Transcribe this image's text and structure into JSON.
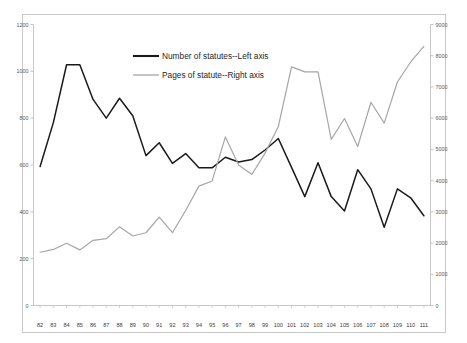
{
  "chart_data": {
    "type": "line",
    "title": "",
    "xlabel": "",
    "ylabel": "",
    "grid": false,
    "legend_position": "upper-center",
    "categories": [
      "82",
      "83",
      "84",
      "85",
      "86",
      "87",
      "88",
      "89",
      "90",
      "91",
      "92",
      "93",
      "94",
      "95",
      "96",
      "97",
      "98",
      "99",
      "100",
      "101",
      "102",
      "103",
      "104",
      "105",
      "106",
      "107",
      "108",
      "109",
      "110",
      "111"
    ],
    "axes": {
      "left": {
        "label": "Number of statutes",
        "min": 0,
        "max": 1200,
        "step": 200,
        "ticks": [
          "0",
          "200",
          "400",
          "600",
          "800",
          "1000",
          "1200"
        ]
      },
      "right": {
        "label": "Pages of statute",
        "min": 0,
        "max": 9000,
        "step": 1000,
        "ticks": [
          "0",
          "1000",
          "2000",
          "3000",
          "4000",
          "5000",
          "6000",
          "7000",
          "8000",
          "9000"
        ]
      }
    },
    "series": [
      {
        "name": "Number of statutes--Left axis",
        "axis": "left",
        "color": "#1a1a1a",
        "values": [
          594,
          781,
          1028,
          1028,
          880,
          800,
          885,
          810,
          640,
          695,
          607,
          649,
          588,
          588,
          633,
          613,
          623,
          664,
          713,
          590,
          465,
          610,
          465,
          404,
          580,
          498,
          334,
          498,
          460,
          383
        ]
      },
      {
        "name": "Pages of statute--Right axis",
        "axis": "right",
        "color": "#a6a6a6",
        "values": [
          1706,
          1795,
          1993,
          1781,
          2089,
          2139,
          2519,
          2225,
          2330,
          2834,
          2331,
          3043,
          3824,
          3989,
          5400,
          4500,
          4195,
          4880,
          5733,
          7641,
          7481,
          7484,
          5319,
          5989,
          5093,
          6510,
          5841,
          7157,
          7800,
          8300
        ]
      }
    ],
    "legend": [
      {
        "label": "Number of statutes--Left axis",
        "color": "#1a1a1a"
      },
      {
        "label": "Pages of statute--Right axis",
        "color": "#a6a6a6"
      }
    ]
  }
}
